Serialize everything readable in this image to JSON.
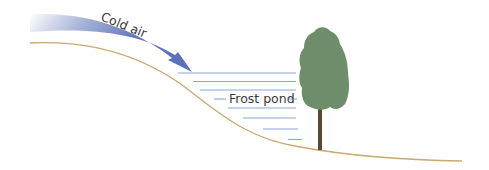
{
  "diagram": {
    "labels": {
      "cold_air": "Cold air",
      "frost_pond": "Frost pond"
    },
    "colors": {
      "cold_air_arrow": "#5b72b8",
      "pond_lines": "#8aa6d6",
      "ground_line": "#c9a96e",
      "tree_canopy": "#6e8d6a",
      "tree_trunk": "#5b4a2e",
      "text": "#3a3a3a"
    },
    "elements": [
      "cold-air-arrow",
      "ground-slope",
      "frost-pond-lines",
      "tree"
    ]
  }
}
